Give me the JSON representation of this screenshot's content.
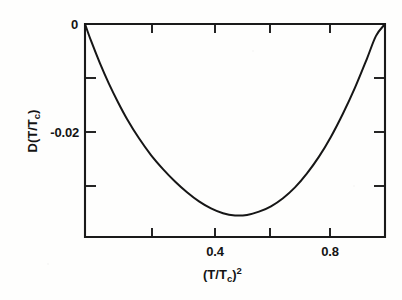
{
  "figure": {
    "background_color": "#fefefd",
    "ink_color": "#161616"
  },
  "axes": {
    "x_label_parts": {
      "open": "(",
      "numerator": "T",
      "slash": "/",
      "denominator": "T",
      "denominator_sub": "c",
      "close": ")",
      "exponent": "2"
    },
    "x_label_text": "(T/Tc)2",
    "y_label_parts": {
      "name": "D",
      "open": "(",
      "numerator": "T",
      "slash": "/",
      "denominator": "T",
      "denominator_sub": "c",
      "close": ")"
    },
    "y_label_text": "D(T/Tc)",
    "x_tick_labels": [
      "0.4",
      "0.8"
    ],
    "y_tick_labels": [
      "0",
      "-0.02"
    ]
  },
  "chart_data": {
    "type": "line",
    "title": "",
    "subtitle": "",
    "xlabel": "(T/Tc)^2",
    "ylabel": "D(T/Tc)",
    "xlim": [
      0.0,
      1.0
    ],
    "ylim": [
      -0.0395,
      0.0
    ],
    "grid": false,
    "legend": "none",
    "x_major_ticks": [
      0.4,
      0.8
    ],
    "x_minor_ticks": [
      0.0,
      0.2,
      0.6,
      1.0
    ],
    "y_major_ticks": [
      0,
      -0.02
    ],
    "y_minor_ticks": [
      -0.01,
      -0.03
    ],
    "annotations": [],
    "series": [
      {
        "name": "D(T/Tc)",
        "x": [
          0.0,
          0.02,
          0.05,
          0.08,
          0.11,
          0.14,
          0.18,
          0.22,
          0.26,
          0.3,
          0.34,
          0.38,
          0.42,
          0.46,
          0.5,
          0.54,
          0.58,
          0.62,
          0.66,
          0.7,
          0.74,
          0.78,
          0.82,
          0.86,
          0.9,
          0.94,
          0.97,
          1.0
        ],
        "y": [
          0.0,
          -0.0031,
          -0.0073,
          -0.0111,
          -0.0145,
          -0.0176,
          -0.0212,
          -0.0243,
          -0.0269,
          -0.0292,
          -0.0312,
          -0.0329,
          -0.0342,
          -0.0351,
          -0.0355,
          -0.0354,
          -0.0348,
          -0.0338,
          -0.0323,
          -0.0303,
          -0.0277,
          -0.0246,
          -0.0209,
          -0.0166,
          -0.0118,
          -0.0064,
          -0.0022,
          0.0
        ]
      }
    ],
    "minimum": {
      "x": 0.5,
      "y": -0.0355
    }
  }
}
